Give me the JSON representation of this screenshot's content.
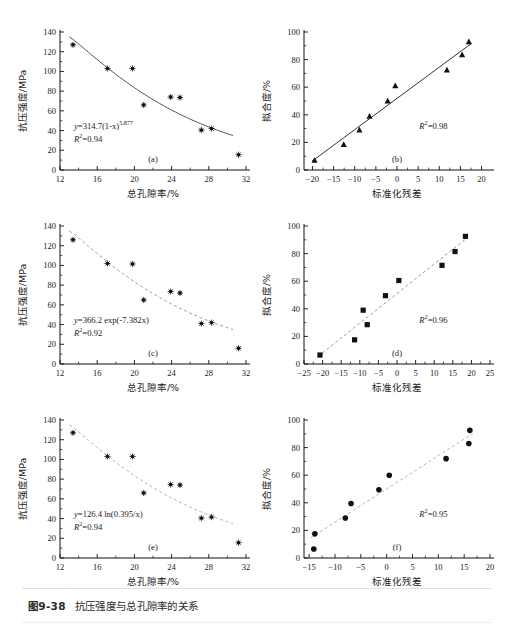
{
  "caption": {
    "number": "图9-38",
    "text": "抗压强度与总孔隙率的关系"
  },
  "axis_titles": {
    "strength_y": "抗压强度/MPa",
    "porosity_x": "总孔隙率/%",
    "fit_y": "拟合度/%",
    "residual_x": "标准化残差"
  },
  "chart_data": [
    {
      "type": "scatter",
      "panel": "(a)",
      "title": "",
      "xlabel": "总孔隙率/%",
      "ylabel": "抗压强度/MPa",
      "xlim": [
        12,
        32
      ],
      "ylim": [
        0,
        140
      ],
      "xticks": [
        12,
        16,
        20,
        24,
        28,
        32
      ],
      "yticks": [
        0,
        20,
        40,
        60,
        80,
        100,
        120,
        140
      ],
      "marker": "star",
      "grid": false,
      "legend": "none",
      "annotations": {
        "equation": "y=314.7(1-x)",
        "exponent": "5.877",
        "r2_label": "R",
        "r2_sup": "2",
        "r2_value": "=0.94"
      },
      "fit_line": {
        "style": "solid",
        "color": "#555555"
      },
      "x": [
        13.4,
        17.1,
        19.8,
        21.0,
        23.9,
        24.9,
        27.2,
        28.3,
        31.2
      ],
      "y": [
        127,
        103,
        103,
        66,
        74,
        73.5,
        40.5,
        42,
        15.5
      ]
    },
    {
      "type": "scatter",
      "panel": "(b)",
      "title": "",
      "xlabel": "标准化残差",
      "ylabel": "拟合度/%",
      "xlim": [
        -22,
        22
      ],
      "ylim": [
        0,
        100
      ],
      "xticks": [
        -20,
        -15,
        -10,
        -5,
        0,
        5,
        10,
        15,
        20
      ],
      "yticks": [
        0,
        20,
        40,
        60,
        80,
        100
      ],
      "marker": "triangle",
      "grid": false,
      "legend": "none",
      "annotations": {
        "r2_label": "R",
        "r2_sup": "2",
        "r2_value": "=0.98"
      },
      "fit_line": {
        "style": "solid",
        "color": "#333333"
      },
      "x": [
        -19.5,
        -12.6,
        -8.9,
        -6.5,
        -2.2,
        -0.4,
        11.8,
        15.4,
        17.0
      ],
      "y": [
        7,
        18.5,
        29,
        39,
        50,
        61,
        72.5,
        83.5,
        93
      ]
    },
    {
      "type": "scatter",
      "panel": "(c)",
      "title": "",
      "xlabel": "总孔隙率/%",
      "ylabel": "抗压强度/MPa",
      "xlim": [
        12,
        32
      ],
      "ylim": [
        0,
        140
      ],
      "xticks": [
        12,
        16,
        20,
        24,
        28,
        32
      ],
      "yticks": [
        0,
        20,
        40,
        60,
        80,
        100,
        120,
        140
      ],
      "marker": "star",
      "grid": false,
      "legend": "none",
      "annotations": {
        "equation": "y=366.2 exp(-7.382x)",
        "r2_label": "R",
        "r2_sup": "2",
        "r2_value": "=0.92"
      },
      "fit_line": {
        "style": "dashed",
        "color": "#9a9a9a"
      },
      "x": [
        13.4,
        17.1,
        19.8,
        21.0,
        23.9,
        24.9,
        27.2,
        28.3,
        31.2
      ],
      "y": [
        126,
        102,
        101.5,
        65,
        73.5,
        72,
        41,
        42,
        16
      ]
    },
    {
      "type": "scatter",
      "panel": "(d)",
      "title": "",
      "xlabel": "标准化残差",
      "ylabel": "拟合度/%",
      "xlim": [
        -25,
        25
      ],
      "ylim": [
        0,
        100
      ],
      "xticks": [
        -25,
        -20,
        -15,
        -10,
        -5,
        0,
        5,
        10,
        15,
        20,
        25
      ],
      "yticks": [
        0,
        20,
        40,
        60,
        80,
        100
      ],
      "marker": "square",
      "grid": false,
      "legend": "none",
      "annotations": {
        "r2_label": "R",
        "r2_sup": "2",
        "r2_value": "=0.96"
      },
      "fit_line": {
        "style": "dashed",
        "color": "#9a9a9a"
      },
      "x": [
        -20.7,
        -11.4,
        -9.1,
        -8.0,
        -3.1,
        0.5,
        12.1,
        15.6,
        18.4
      ],
      "y": [
        6.5,
        17.5,
        39,
        28.5,
        49.5,
        60.5,
        71.5,
        81.5,
        92.5
      ]
    },
    {
      "type": "scatter",
      "panel": "(e)",
      "title": "",
      "xlabel": "总孔隙率/%",
      "ylabel": "抗压强度/MPa",
      "xlim": [
        12,
        32
      ],
      "ylim": [
        0,
        140
      ],
      "xticks": [
        12,
        16,
        20,
        24,
        28,
        32
      ],
      "yticks": [
        0,
        20,
        40,
        60,
        80,
        100,
        120,
        140
      ],
      "marker": "star",
      "grid": false,
      "legend": "none",
      "annotations": {
        "equation": "y=126.4 ln(0.395/x)",
        "r2_label": "R",
        "r2_sup": "2",
        "r2_value": "=0.94"
      },
      "fit_line": {
        "style": "dashed",
        "color": "#b5b5b5"
      },
      "x": [
        13.4,
        17.1,
        19.8,
        21.0,
        23.9,
        24.9,
        27.2,
        28.3,
        31.2
      ],
      "y": [
        127,
        103,
        103,
        66,
        74.5,
        74,
        40.5,
        41.5,
        15.5
      ]
    },
    {
      "type": "scatter",
      "panel": "(f)",
      "title": "",
      "xlabel": "标准化残差",
      "ylabel": "拟合度/%",
      "xlim": [
        -16,
        20
      ],
      "ylim": [
        0,
        100
      ],
      "xticks": [
        -15,
        -10,
        -5,
        0,
        5,
        10,
        15,
        20
      ],
      "yticks": [
        0,
        20,
        40,
        60,
        80,
        100
      ],
      "marker": "circle",
      "grid": false,
      "legend": "none",
      "annotations": {
        "r2_label": "R",
        "r2_sup": "2",
        "r2_value": "=0.95"
      },
      "fit_line": {
        "style": "dashed",
        "color": "#b5b5b5"
      },
      "x": [
        -14.1,
        -13.9,
        -8.0,
        -6.9,
        -1.5,
        0.5,
        11.5,
        15.9,
        16.1
      ],
      "y": [
        6.5,
        17.5,
        29,
        39.5,
        49.5,
        60,
        72,
        83,
        92.5
      ]
    }
  ]
}
